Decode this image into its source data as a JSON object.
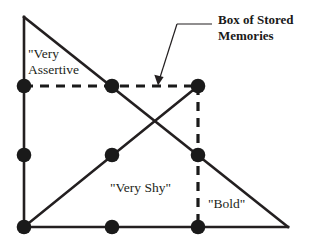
{
  "figure": {
    "kind": "geometric-diagram",
    "background_color": "#ffffff",
    "stroke_color": "#231f20",
    "node_color": "#1a1a1a"
  },
  "labels": {
    "very_assertive": "\"Very\nAssertive",
    "very_shy": "\"Very Shy\"",
    "bold": "\"Bold\"",
    "callout": "Box of Stored\nMemories"
  },
  "diagram_data": {
    "type": "diagram",
    "canvas": {
      "width": 315,
      "height": 246
    },
    "triangle": {
      "apex": [
        24,
        17
      ],
      "bottom_left": [
        24,
        227
      ],
      "bottom_right": [
        288,
        227
      ],
      "solid_edges": [
        {
          "name": "left-vertical-edge",
          "from": [
            24,
            17
          ],
          "to": [
            24,
            227
          ]
        },
        {
          "name": "bottom-horizontal-edge",
          "from": [
            24,
            227
          ],
          "to": [
            288,
            227
          ]
        },
        {
          "name": "hypotenuse-descending",
          "from": [
            24,
            17
          ],
          "to": [
            288,
            227
          ]
        }
      ]
    },
    "solid_diagonal_ascending": {
      "from": [
        24,
        227
      ],
      "to": [
        198,
        86
      ]
    },
    "dashed_box_edges": [
      {
        "name": "dashed-horizontal",
        "from": [
          24,
          86
        ],
        "to": [
          198,
          86
        ]
      },
      {
        "name": "dashed-vertical",
        "from": [
          198,
          86
        ],
        "to": [
          198,
          227
        ]
      }
    ],
    "nodes": [
      {
        "id": "n-left-upper",
        "x": 24,
        "y": 86
      },
      {
        "id": "n-left-middle",
        "x": 24,
        "y": 155
      },
      {
        "id": "n-left-bottom",
        "x": 24,
        "y": 227
      },
      {
        "id": "n-mid-upper",
        "x": 112,
        "y": 86
      },
      {
        "id": "n-mid-middle",
        "x": 112,
        "y": 155
      },
      {
        "id": "n-mid-bottom",
        "x": 112,
        "y": 227
      },
      {
        "id": "n-right-upper",
        "x": 198,
        "y": 86
      },
      {
        "id": "n-right-middle",
        "x": 198,
        "y": 155
      },
      {
        "id": "n-right-bottom",
        "x": 198,
        "y": 227
      }
    ],
    "node_radius": 7,
    "callout_leader": {
      "horizontal": {
        "from": [
          212,
          24
        ],
        "to": [
          177,
          24
        ]
      },
      "diagonal": {
        "from": [
          177,
          24
        ],
        "to": [
          158,
          83
        ]
      },
      "arrow_tip": [
        158,
        83
      ],
      "points_at": "dashed-horizontal"
    }
  }
}
